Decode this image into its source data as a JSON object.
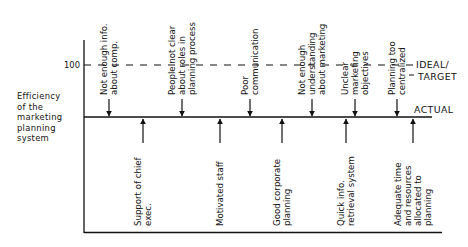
{
  "diagram": {
    "type": "force-field",
    "y_axis_label": [
      "Efficiency",
      "of the",
      "marketing",
      "planning",
      "system"
    ],
    "ideal_value_label": "100",
    "ideal_label": [
      "IDEAL/",
      "TARGET"
    ],
    "actual_label": "ACTUAL",
    "restraining_forces": [
      {
        "lines": [
          "Not enough info.",
          "about comp."
        ]
      },
      {
        "lines": [
          "People not clear",
          "about roles in",
          "planning process"
        ]
      },
      {
        "lines": [
          "Poor",
          "communication"
        ]
      },
      {
        "lines": [
          "Not enough",
          "understanding",
          "about marketing"
        ]
      },
      {
        "lines": [
          "Unclear",
          "marketing",
          "objectives"
        ]
      },
      {
        "lines": [
          "Planning too",
          "centralized"
        ]
      }
    ],
    "driving_forces": [
      {
        "lines": [
          "Support of chief",
          "exec."
        ]
      },
      {
        "lines": [
          "Motivated staff"
        ]
      },
      {
        "lines": [
          "Good corporate",
          "planning"
        ]
      },
      {
        "lines": [
          "Quick info.",
          "retrieval system"
        ]
      },
      {
        "lines": [
          "Adequate time",
          "and resources",
          "allocated to",
          "planning"
        ]
      }
    ]
  }
}
